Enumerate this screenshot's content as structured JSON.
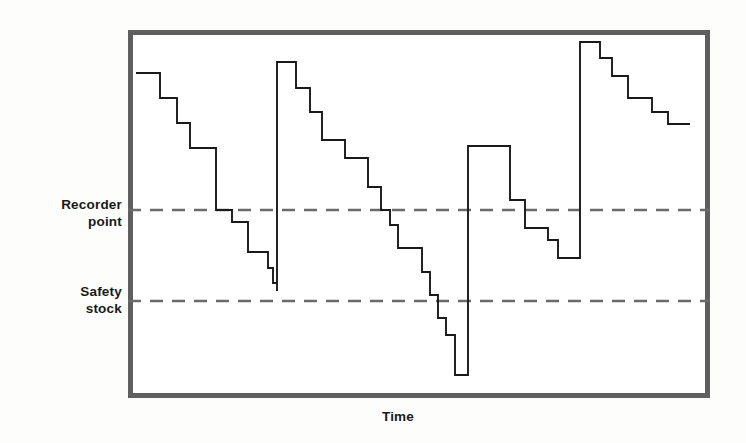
{
  "figure": {
    "title": "",
    "axis_x_label": "Time",
    "threshold_labels": {
      "reorder": "Recorder\npoint",
      "safety": "Safety\nstock"
    },
    "colors": {
      "frame": "#5f5f5f",
      "line": "#1a1a1a",
      "dashed": "#6b6b6b",
      "background": "#ffffff",
      "page_background": "#fdfdfc",
      "text": "#1a1a1a"
    }
  },
  "chart_data": {
    "type": "line",
    "title": "",
    "xlabel": "Time",
    "ylabel": "",
    "grid": false,
    "legend": null,
    "axis_ranges": {
      "x_pixel": [
        128,
        710
      ],
      "y_pixel": [
        30,
        398
      ]
    },
    "threshold_lines": [
      {
        "name": "Recorder point",
        "y_pixel": 210,
        "style": "dashed"
      },
      {
        "name": "Safety stock",
        "y_pixel": 301,
        "style": "dashed"
      }
    ],
    "series": [
      {
        "name": "Inventory level",
        "style": "step",
        "points_pixel": [
          [
            136,
            73
          ],
          [
            160,
            73
          ],
          [
            160,
            98
          ],
          [
            177,
            98
          ],
          [
            177,
            123
          ],
          [
            190,
            123
          ],
          [
            190,
            148
          ],
          [
            216,
            148
          ],
          [
            216,
            210
          ],
          [
            232,
            210
          ],
          [
            232,
            222
          ],
          [
            248,
            222
          ],
          [
            248,
            252
          ],
          [
            268,
            252
          ],
          [
            268,
            268
          ],
          [
            273,
            268
          ],
          [
            273,
            283
          ],
          [
            277,
            283
          ],
          [
            277,
            291
          ],
          [
            277,
            62
          ],
          [
            296,
            62
          ],
          [
            296,
            88
          ],
          [
            310,
            88
          ],
          [
            310,
            112
          ],
          [
            322,
            112
          ],
          [
            322,
            140
          ],
          [
            345,
            140
          ],
          [
            345,
            158
          ],
          [
            368,
            158
          ],
          [
            368,
            187
          ],
          [
            381,
            187
          ],
          [
            381,
            210
          ],
          [
            390,
            210
          ],
          [
            390,
            225
          ],
          [
            398,
            225
          ],
          [
            398,
            248
          ],
          [
            422,
            248
          ],
          [
            422,
            272
          ],
          [
            430,
            272
          ],
          [
            430,
            295
          ],
          [
            438,
            295
          ],
          [
            438,
            318
          ],
          [
            446,
            318
          ],
          [
            446,
            335
          ],
          [
            455,
            335
          ],
          [
            455,
            375
          ],
          [
            468,
            375
          ],
          [
            468,
            146
          ],
          [
            510,
            146
          ],
          [
            510,
            200
          ],
          [
            525,
            200
          ],
          [
            525,
            228
          ],
          [
            548,
            228
          ],
          [
            548,
            240
          ],
          [
            558,
            240
          ],
          [
            558,
            258
          ],
          [
            580,
            258
          ],
          [
            580,
            42
          ],
          [
            600,
            42
          ],
          [
            600,
            58
          ],
          [
            612,
            58
          ],
          [
            612,
            76
          ],
          [
            628,
            76
          ],
          [
            628,
            98
          ],
          [
            652,
            98
          ],
          [
            652,
            112
          ],
          [
            668,
            112
          ],
          [
            668,
            124
          ],
          [
            690,
            124
          ]
        ]
      }
    ]
  }
}
